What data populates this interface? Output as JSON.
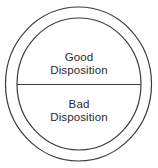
{
  "diagram": {
    "background_color": "#ffffff",
    "stroke_color": "#3a3a3a",
    "text_color": "#2b2b2b",
    "shapes": {
      "outer_circle": {
        "name": "outer-circle",
        "cx": 78.5,
        "cy": 84,
        "rx": 73,
        "ry": 77
      },
      "inner_circle": {
        "name": "inner-circle",
        "cx": 79,
        "cy": 84,
        "rx": 62,
        "ry": 66
      },
      "divider_line": {
        "name": "horizontal-divider",
        "x1": 17,
        "y1": 84.5,
        "x2": 141,
        "y2": 84.5
      }
    },
    "regions": [
      {
        "id": "good",
        "position": "top-half",
        "line1": "Good",
        "line2": "Disposition"
      },
      {
        "id": "bad",
        "position": "bottom-half",
        "line1": "Bad",
        "line2": "Disposition"
      }
    ]
  }
}
